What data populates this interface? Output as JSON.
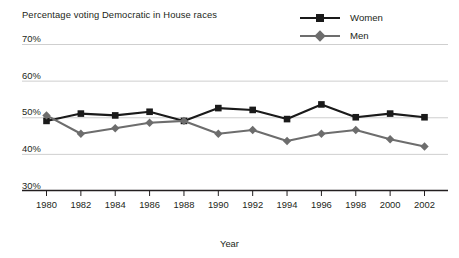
{
  "chart_data": {
    "type": "line",
    "title": "Percentage voting Democratic in House races",
    "xlabel": "Year",
    "ylabel": "",
    "categories": [
      1980,
      1982,
      1984,
      1986,
      1988,
      1990,
      1992,
      1994,
      1996,
      1998,
      2000,
      2002
    ],
    "x_tick_labels": [
      "1980",
      "1982",
      "1984",
      "1986",
      "1988",
      "1990",
      "1992",
      "1994",
      "1996",
      "1998",
      "2000",
      "2002"
    ],
    "y_tick_labels": [
      "70%",
      "60%",
      "50%",
      "40%",
      "30%"
    ],
    "y_tick_values": [
      70,
      60,
      50,
      40,
      30
    ],
    "ylim": [
      30,
      70
    ],
    "xlim": [
      1980,
      2002
    ],
    "grid": true,
    "legend_position": "top-right",
    "series": [
      {
        "name": "Women",
        "color": "#1a1a1a",
        "marker": "square",
        "values": [
          49.0,
          51.0,
          50.5,
          51.5,
          49.0,
          52.5,
          52.0,
          49.5,
          53.5,
          50.0,
          51.0,
          50.0
        ]
      },
      {
        "name": "Men",
        "color": "#6d6d6d",
        "marker": "diamond",
        "values": [
          50.5,
          45.5,
          47.0,
          48.5,
          49.0,
          45.5,
          46.5,
          43.5,
          45.5,
          46.5,
          44.0,
          42.0
        ]
      }
    ]
  },
  "legend": {
    "items": [
      {
        "label": "Women",
        "icon": "square-marker-icon"
      },
      {
        "label": "Men",
        "icon": "diamond-marker-icon"
      }
    ]
  },
  "colors": {
    "women": "#1a1a1a",
    "men": "#6d6d6d",
    "grid": "#c9c9c9",
    "axis": "#231f20",
    "background": "#ffffff",
    "text": "#231f20"
  }
}
